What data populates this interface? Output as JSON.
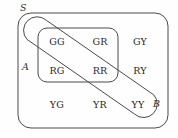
{
  "figure": {
    "kind": "venn-diagram",
    "background_color": "#fefefe",
    "stroke_color": "#4a4a4a",
    "text_color": "#2a2a2a"
  },
  "sets": {
    "universe": {
      "label": "S",
      "shape": "rounded-rectangle",
      "x": 18,
      "y": 13,
      "width": 150,
      "height": 115,
      "radius": 13,
      "label_x": 22,
      "label_y": 3
    },
    "a": {
      "label": "A",
      "shape": "rounded-rectangle",
      "x": 38,
      "y": 28,
      "width": 80,
      "height": 54,
      "radius": 9,
      "label_x": 26,
      "label_y": 66,
      "members": [
        "GG",
        "GR",
        "RG",
        "RR"
      ]
    },
    "b": {
      "label": "B",
      "shape": "diagonal-capsule",
      "label_x": 154,
      "label_y": 104,
      "members": [
        "GG",
        "RR",
        "YY"
      ]
    }
  },
  "elements": [
    {
      "text": "GG",
      "x": 57,
      "y": 42,
      "in_a": true,
      "in_b": true
    },
    {
      "text": "GR",
      "x": 100,
      "y": 42,
      "in_a": true,
      "in_b": false
    },
    {
      "text": "GY",
      "x": 140,
      "y": 42,
      "in_a": false,
      "in_b": false
    },
    {
      "text": "RG",
      "x": 57,
      "y": 71,
      "in_a": true,
      "in_b": false
    },
    {
      "text": "RR",
      "x": 100,
      "y": 71,
      "in_a": true,
      "in_b": true
    },
    {
      "text": "RY",
      "x": 140,
      "y": 71,
      "in_a": false,
      "in_b": false
    },
    {
      "text": "YG",
      "x": 57,
      "y": 105,
      "in_a": false,
      "in_b": false
    },
    {
      "text": "YR",
      "x": 100,
      "y": 105,
      "in_a": false,
      "in_b": false
    },
    {
      "text": "YY",
      "x": 138,
      "y": 105,
      "in_a": false,
      "in_b": true
    }
  ],
  "geometry": {
    "band_path": "M 41.5 20.5 A 13.5 13.5 0 0 0 22.4 39.6 L 126.0 113.3 A 13.5 13.5 0 0 0 145.1 94.2 Z"
  }
}
